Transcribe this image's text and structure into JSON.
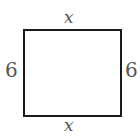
{
  "diagram": {
    "type": "rectangle",
    "labels": {
      "top": "x",
      "bottom": "x",
      "left": "6",
      "right": "6"
    },
    "colors": {
      "stroke": "#1a1a1a",
      "label": "#555555"
    }
  }
}
